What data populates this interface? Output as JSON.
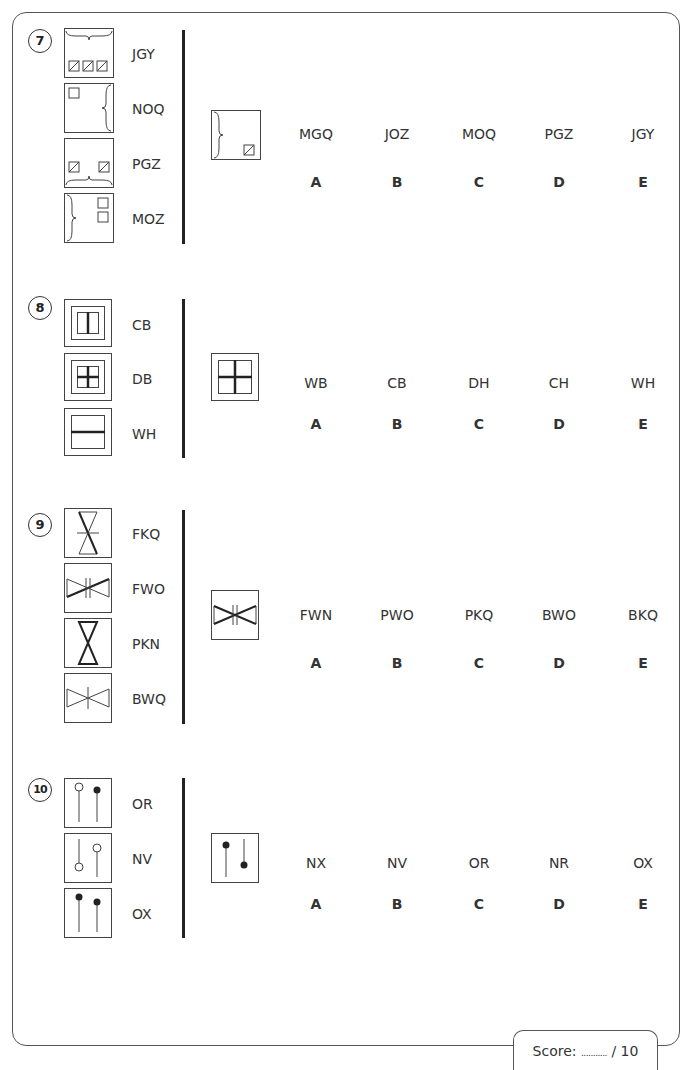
{
  "score": {
    "label": "Score:",
    "dots": "...........",
    "total": "/ 10"
  },
  "letters": [
    "A",
    "B",
    "C",
    "D",
    "E"
  ],
  "questions": [
    {
      "number": "7",
      "options": [
        {
          "code": "JGY",
          "icon": "top-brace-three-hatched-squares-icon"
        },
        {
          "code": "NOQ",
          "icon": "right-brace-one-square-icon"
        },
        {
          "code": "PGZ",
          "icon": "bottom-brace-two-hatched-squares-icon"
        },
        {
          "code": "MOZ",
          "icon": "left-brace-two-squares-icon"
        }
      ],
      "target_icon": "left-brace-one-hatched-square-icon",
      "answers": [
        "MGQ",
        "JOZ",
        "MOQ",
        "PGZ",
        "JGY"
      ]
    },
    {
      "number": "8",
      "options": [
        {
          "code": "CB",
          "icon": "framed-vertical-split-icon"
        },
        {
          "code": "DB",
          "icon": "framed-cross-small-icon"
        },
        {
          "code": "WH",
          "icon": "framed-horizontal-split-icon"
        }
      ],
      "target_icon": "framed-cross-large-icon",
      "answers": [
        "WB",
        "CB",
        "DH",
        "CH",
        "WH"
      ]
    },
    {
      "number": "9",
      "options": [
        {
          "code": "FKQ",
          "icon": "vertical-hourglass-thin-cross-icon"
        },
        {
          "code": "FWO",
          "icon": "horizontal-bowtie-thick-double-bar-icon"
        },
        {
          "code": "PKN",
          "icon": "vertical-hourglass-thick-icon"
        },
        {
          "code": "BWQ",
          "icon": "horizontal-bowtie-thin-cross-icon"
        }
      ],
      "target_icon": "horizontal-bowtie-thick-double-bar-icon",
      "answers": [
        "FWN",
        "PWO",
        "PKQ",
        "BWO",
        "BKQ"
      ]
    },
    {
      "number": "10",
      "options": [
        {
          "code": "OR",
          "icon": "pins-open-top-filled-top-icon"
        },
        {
          "code": "NV",
          "icon": "pins-open-bottom-open-top-icon"
        },
        {
          "code": "OX",
          "icon": "pins-filled-top-filled-top-icon"
        }
      ],
      "target_icon": "pins-filled-top-filled-bottom-icon",
      "answers": [
        "NX",
        "NV",
        "OR",
        "NR",
        "OX"
      ]
    }
  ]
}
